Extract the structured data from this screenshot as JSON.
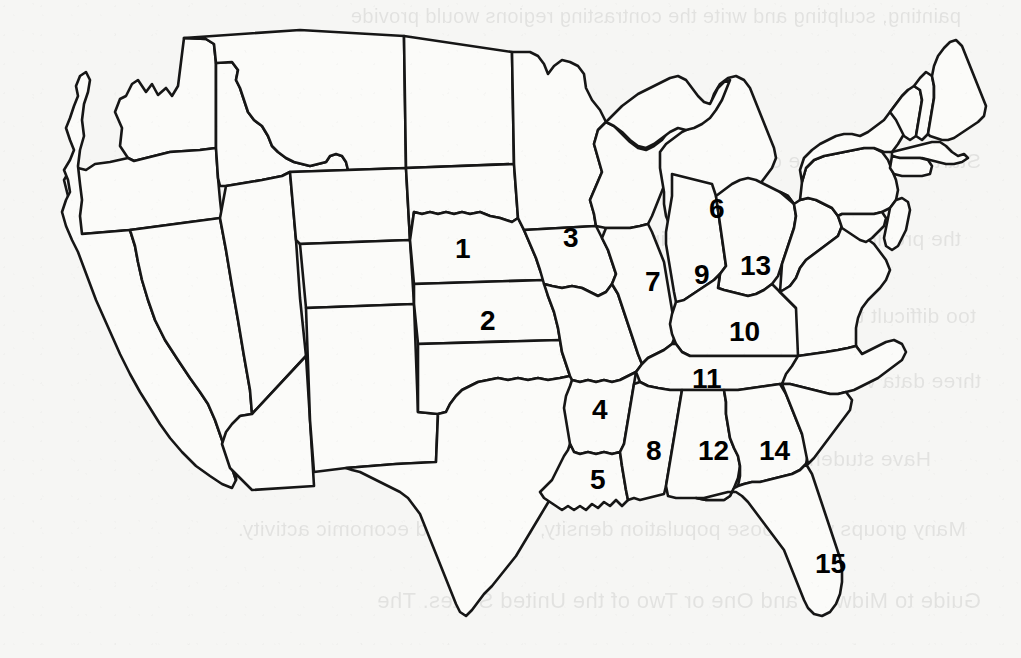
{
  "document": {
    "type": "worksheet",
    "title": "Numbered United States Outline Map",
    "paper_color": "#f6f6f4",
    "ink_color": "#161616",
    "orientation": "landscape"
  },
  "map": {
    "name": "united-states-outline-map",
    "region": "Contiguous United States",
    "style": "black outline, unshaded states",
    "label_count": 15
  },
  "labels": [
    {
      "number": "1",
      "state": "Nebraska",
      "x": 455,
      "y": 235
    },
    {
      "number": "2",
      "state": "Kansas",
      "x": 480,
      "y": 307
    },
    {
      "number": "3",
      "state": "Iowa",
      "x": 563,
      "y": 224
    },
    {
      "number": "4",
      "state": "Arkansas",
      "x": 592,
      "y": 396
    },
    {
      "number": "5",
      "state": "Louisiana",
      "x": 590,
      "y": 466
    },
    {
      "number": "6",
      "state": "Michigan",
      "x": 709,
      "y": 195
    },
    {
      "number": "7",
      "state": "Illinois",
      "x": 645,
      "y": 268
    },
    {
      "number": "8",
      "state": "Mississippi",
      "x": 646,
      "y": 437
    },
    {
      "number": "9",
      "state": "Indiana",
      "x": 694,
      "y": 261
    },
    {
      "number": "10",
      "state": "Kentucky",
      "x": 729,
      "y": 318
    },
    {
      "number": "11",
      "state": "Tennessee",
      "x": 692,
      "y": 365
    },
    {
      "number": "12",
      "state": "Alabama",
      "x": 698,
      "y": 437
    },
    {
      "number": "13",
      "state": "Ohio",
      "x": 740,
      "y": 252
    },
    {
      "number": "14",
      "state": "Georgia",
      "x": 759,
      "y": 437
    },
    {
      "number": "15",
      "state": "Florida",
      "x": 815,
      "y": 550
    }
  ],
  "showthrough": {
    "description": "faint mirrored text bleeding through from the reverse side of the sheet",
    "lines": [
      {
        "text": "painting, sculpting and write the contrasting regions would provide",
        "x": 60,
        "y": 6,
        "size": 20
      },
      {
        "text": "Activity",
        "x": 735,
        "y": 88,
        "size": 22
      },
      {
        "text": "Start by dividing the class into small groups, Ask students to review the list from",
        "x": 40,
        "y": 150,
        "size": 21
      },
      {
        "text": "the previous exercise and eliminate the variables they consider to be",
        "x": 60,
        "y": 228,
        "size": 21
      },
      {
        "text": "too difficult to represent or to measure. Next, direct the students to name the",
        "x": 45,
        "y": 305,
        "size": 21
      },
      {
        "text": "three data variables that offer the most information about this particular region.",
        "x": 40,
        "y": 370,
        "size": 21
      },
      {
        "text": "Have students draw a map of the region to use in the next exercise.",
        "x": 90,
        "y": 448,
        "size": 21
      },
      {
        "text": "Many groups will choose population density, climate, and economic activity.",
        "x": 55,
        "y": 518,
        "size": 21
      },
      {
        "text": "Guide to Midwest and One or Two of the United States. The",
        "x": 40,
        "y": 590,
        "size": 22
      }
    ]
  }
}
